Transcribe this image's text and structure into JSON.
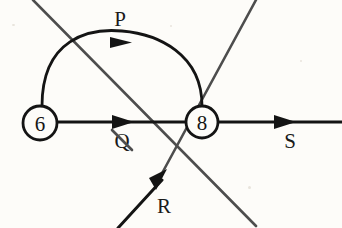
{
  "diagram": {
    "background_color": "#fdfcf9",
    "stroke_color": "#1c1c1c",
    "secondary_stroke_color": "#4a4a4a",
    "width": 342,
    "height": 228,
    "nodes": [
      {
        "id": "n6",
        "label": "6",
        "cx": 40,
        "cy": 123,
        "r": 17,
        "name": "node-circle-6"
      },
      {
        "id": "n8",
        "label": "8",
        "cx": 202,
        "cy": 122,
        "r": 16,
        "name": "node-circle-8"
      }
    ],
    "edges": [
      {
        "id": "P",
        "label": "P",
        "kind": "arc",
        "from": "n6",
        "to": "n8",
        "label_x": 120,
        "label_y": 19,
        "arrow_x": 122,
        "arrow_y": 43,
        "name": "edge-arc-p"
      },
      {
        "id": "Q",
        "label": "Q",
        "kind": "straight",
        "from": "n6",
        "to": "n8",
        "label_x": 122,
        "label_y": 141,
        "arrow_x": 128,
        "arrow_y": 122,
        "name": "edge-line-q"
      },
      {
        "id": "R",
        "label": "R",
        "kind": "diagonal",
        "from": "bottom-left",
        "to": "top-right",
        "label_x": 164,
        "label_y": 206,
        "arrow_x": 160,
        "arrow_y": 177,
        "name": "edge-line-r"
      },
      {
        "id": "S",
        "label": "S",
        "kind": "straight",
        "from": "n8",
        "to": "right-edge",
        "label_x": 290,
        "label_y": 141,
        "arrow_x": 290,
        "arrow_y": 122,
        "name": "edge-line-s"
      }
    ],
    "crossing_lines": [
      {
        "id": "nw-se",
        "x1": 33,
        "y1": 0,
        "x2": 256,
        "y2": 226,
        "name": "crossing-line-northwest-southeast"
      },
      {
        "id": "sw-ne",
        "x1": 118,
        "y1": 228,
        "x2": 256,
        "y2": 0,
        "name": "crossing-line-southwest-northeast"
      }
    ],
    "intersection": {
      "x": 140,
      "y": 112,
      "name": "lines-intersection-point"
    }
  }
}
